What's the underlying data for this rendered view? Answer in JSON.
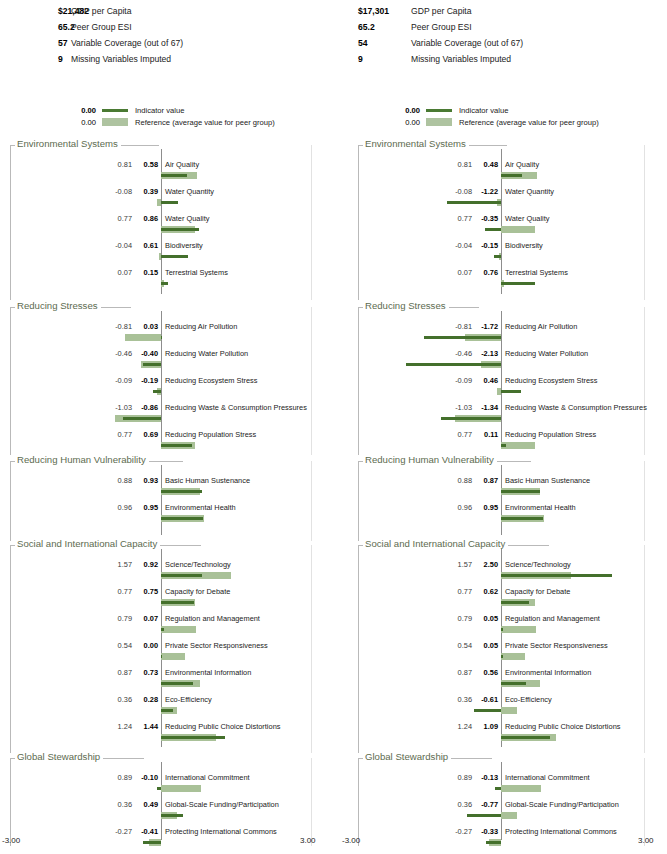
{
  "axis": {
    "min": -3.0,
    "max": 3.0,
    "min_label": "-3.00",
    "max_label": "3.00"
  },
  "colors": {
    "indicator": "#44702c",
    "reference": "#a9c198",
    "section_title": "#5d6b4f",
    "frame": "#b9b9b9",
    "zero_axis": "#8d8d8d"
  },
  "legend": {
    "indicator": {
      "value": "0.00",
      "label": "Indicator value"
    },
    "reference": {
      "value": "0.00",
      "label": "Reference (average value for peer group)"
    }
  },
  "panels": [
    {
      "id": "left-country",
      "stats": [
        {
          "value": "$21,482",
          "label": "GDP per Capita"
        },
        {
          "value": "65.2",
          "label": "Peer Group ESI"
        },
        {
          "value": "57",
          "label": "Variable Coverage (out of 67)"
        },
        {
          "value": "9",
          "label": "Missing Variables Imputed"
        }
      ],
      "sections": [
        {
          "title": "Environmental Systems",
          "rows": [
            {
              "name": "Air Quality",
              "reference": 0.81,
              "indicator": 0.58,
              "ref_label": "0.81",
              "ind_label": "0.58"
            },
            {
              "name": "Water Quantity",
              "reference": -0.08,
              "indicator": 0.39,
              "ref_label": "-0.08",
              "ind_label": "0.39"
            },
            {
              "name": "Water Quality",
              "reference": 0.77,
              "indicator": 0.86,
              "ref_label": "0.77",
              "ind_label": "0.86"
            },
            {
              "name": "Biodiversity",
              "reference": -0.04,
              "indicator": 0.61,
              "ref_label": "-0.04",
              "ind_label": "0.61"
            },
            {
              "name": "Terrestrial Systems",
              "reference": 0.07,
              "indicator": 0.15,
              "ref_label": "0.07",
              "ind_label": "0.15"
            }
          ]
        },
        {
          "title": "Reducing Stresses",
          "rows": [
            {
              "name": "Reducing Air Pollution",
              "reference": -0.81,
              "indicator": 0.03,
              "ref_label": "-0.81",
              "ind_label": "0.03"
            },
            {
              "name": "Reducing Water Pollution",
              "reference": -0.46,
              "indicator": -0.4,
              "ref_label": "-0.46",
              "ind_label": "-0.40"
            },
            {
              "name": "Reducing Ecosystem Stress",
              "reference": -0.09,
              "indicator": -0.19,
              "ref_label": "-0.09",
              "ind_label": "-0.19"
            },
            {
              "name": "Reducing Waste & Consumption Pressures",
              "reference": -1.03,
              "indicator": -0.86,
              "ref_label": "-1.03",
              "ind_label": "-0.86"
            },
            {
              "name": "Reducing Population Stress",
              "reference": 0.77,
              "indicator": 0.69,
              "ref_label": "0.77",
              "ind_label": "0.69"
            }
          ]
        },
        {
          "title": "Reducing Human Vulnerability",
          "rows": [
            {
              "name": "Basic Human Sustenance",
              "reference": 0.88,
              "indicator": 0.93,
              "ref_label": "0.88",
              "ind_label": "0.93"
            },
            {
              "name": "Environmental Health",
              "reference": 0.96,
              "indicator": 0.95,
              "ref_label": "0.96",
              "ind_label": "0.95"
            }
          ]
        },
        {
          "title": "Social and International Capacity",
          "rows": [
            {
              "name": "Science/Technology",
              "reference": 1.57,
              "indicator": 0.92,
              "ref_label": "1.57",
              "ind_label": "0.92"
            },
            {
              "name": "Capacity for Debate",
              "reference": 0.77,
              "indicator": 0.75,
              "ref_label": "0.77",
              "ind_label": "0.75"
            },
            {
              "name": "Regulation and Management",
              "reference": 0.79,
              "indicator": 0.07,
              "ref_label": "0.79",
              "ind_label": "0.07"
            },
            {
              "name": "Private Sector Responsiveness",
              "reference": 0.54,
              "indicator": 0.0,
              "ref_label": "0.54",
              "ind_label": "0.00"
            },
            {
              "name": "Environmental Information",
              "reference": 0.87,
              "indicator": 0.73,
              "ref_label": "0.87",
              "ind_label": "0.73"
            },
            {
              "name": "Eco-Efficiency",
              "reference": 0.36,
              "indicator": 0.28,
              "ref_label": "0.36",
              "ind_label": "0.28"
            },
            {
              "name": "Reducing Public Choice Distortions",
              "reference": 1.24,
              "indicator": 1.44,
              "ref_label": "1.24",
              "ind_label": "1.44"
            }
          ]
        },
        {
          "title": "Global Stewardship",
          "rows": [
            {
              "name": "International Commitment",
              "reference": 0.89,
              "indicator": -0.1,
              "ref_label": "0.89",
              "ind_label": "-0.10"
            },
            {
              "name": "Global-Scale Funding/Participation",
              "reference": 0.36,
              "indicator": 0.49,
              "ref_label": "0.36",
              "ind_label": "0.49"
            },
            {
              "name": "Protecting International Commons",
              "reference": -0.27,
              "indicator": -0.41,
              "ref_label": "-0.27",
              "ind_label": "-0.41"
            }
          ]
        }
      ]
    },
    {
      "id": "right-country",
      "stats": [
        {
          "value": "$17,301",
          "label": "GDP per Capita"
        },
        {
          "value": "65.2",
          "label": "Peer Group ESI"
        },
        {
          "value": "54",
          "label": "Variable Coverage (out of 67)"
        },
        {
          "value": "9",
          "label": "Missing Variables Imputed"
        }
      ],
      "sections": [
        {
          "title": "Environmental Systems",
          "rows": [
            {
              "name": "Air Quality",
              "reference": 0.81,
              "indicator": 0.48,
              "ref_label": "0.81",
              "ind_label": "0.48"
            },
            {
              "name": "Water Quantity",
              "reference": -0.08,
              "indicator": -1.22,
              "ref_label": "-0.08",
              "ind_label": "-1.22"
            },
            {
              "name": "Water Quality",
              "reference": 0.77,
              "indicator": -0.35,
              "ref_label": "0.77",
              "ind_label": "-0.35"
            },
            {
              "name": "Biodiversity",
              "reference": -0.04,
              "indicator": -0.15,
              "ref_label": "-0.04",
              "ind_label": "-0.15"
            },
            {
              "name": "Terrestrial Systems",
              "reference": 0.07,
              "indicator": 0.76,
              "ref_label": "0.07",
              "ind_label": "0.76"
            }
          ]
        },
        {
          "title": "Reducing Stresses",
          "rows": [
            {
              "name": "Reducing Air Pollution",
              "reference": -0.81,
              "indicator": -1.72,
              "ref_label": "-0.81",
              "ind_label": "-1.72"
            },
            {
              "name": "Reducing Water Pollution",
              "reference": -0.46,
              "indicator": -2.13,
              "ref_label": "-0.46",
              "ind_label": "-2.13"
            },
            {
              "name": "Reducing Ecosystem Stress",
              "reference": -0.09,
              "indicator": 0.46,
              "ref_label": "-0.09",
              "ind_label": "0.46"
            },
            {
              "name": "Reducing Waste & Consumption Pressures",
              "reference": -1.03,
              "indicator": -1.34,
              "ref_label": "-1.03",
              "ind_label": "-1.34"
            },
            {
              "name": "Reducing Population Stress",
              "reference": 0.77,
              "indicator": 0.11,
              "ref_label": "0.77",
              "ind_label": "0.11"
            }
          ]
        },
        {
          "title": "Reducing Human Vulnerability",
          "rows": [
            {
              "name": "Basic Human Sustenance",
              "reference": 0.88,
              "indicator": 0.87,
              "ref_label": "0.88",
              "ind_label": "0.87"
            },
            {
              "name": "Environmental Health",
              "reference": 0.96,
              "indicator": 0.95,
              "ref_label": "0.96",
              "ind_label": "0.95"
            }
          ]
        },
        {
          "title": "Social and International Capacity",
          "rows": [
            {
              "name": "Science/Technology",
              "reference": 1.57,
              "indicator": 2.5,
              "ref_label": "1.57",
              "ind_label": "2.50"
            },
            {
              "name": "Capacity for Debate",
              "reference": 0.77,
              "indicator": 0.62,
              "ref_label": "0.77",
              "ind_label": "0.62"
            },
            {
              "name": "Regulation and Management",
              "reference": 0.79,
              "indicator": 0.05,
              "ref_label": "0.79",
              "ind_label": "0.05"
            },
            {
              "name": "Private Sector Responsiveness",
              "reference": 0.54,
              "indicator": 0.05,
              "ref_label": "0.54",
              "ind_label": "0.05"
            },
            {
              "name": "Environmental Information",
              "reference": 0.87,
              "indicator": 0.56,
              "ref_label": "0.87",
              "ind_label": "0.56"
            },
            {
              "name": "Eco-Efficiency",
              "reference": 0.36,
              "indicator": -0.61,
              "ref_label": "0.36",
              "ind_label": "-0.61"
            },
            {
              "name": "Reducing Public Choice Distortions",
              "reference": 1.24,
              "indicator": 1.09,
              "ref_label": "1.24",
              "ind_label": "1.09"
            }
          ]
        },
        {
          "title": "Global Stewardship",
          "rows": [
            {
              "name": "International Commitment",
              "reference": 0.89,
              "indicator": -0.13,
              "ref_label": "0.89",
              "ind_label": "-0.13"
            },
            {
              "name": "Global-Scale Funding/Participation",
              "reference": 0.36,
              "indicator": -0.77,
              "ref_label": "0.36",
              "ind_label": "-0.77"
            },
            {
              "name": "Protecting International Commons",
              "reference": -0.27,
              "indicator": -0.33,
              "ref_label": "-0.27",
              "ind_label": "-0.33"
            }
          ]
        }
      ]
    }
  ],
  "chart_data": {
    "type": "bar",
    "title": "",
    "xlabel": "",
    "ylabel": "",
    "xlim": [
      -3.0,
      3.0
    ],
    "grid": false,
    "orientation": "horizontal",
    "legend_position": "top",
    "series": [
      {
        "name": "Indicator value",
        "color": "#44702c"
      },
      {
        "name": "Reference (average value for peer group)",
        "color": "#a9c198"
      }
    ],
    "panels": [
      {
        "name": "left-country",
        "categories": [
          "Air Quality",
          "Water Quantity",
          "Water Quality",
          "Biodiversity",
          "Terrestrial Systems",
          "Reducing Air Pollution",
          "Reducing Water Pollution",
          "Reducing Ecosystem Stress",
          "Reducing Waste & Consumption Pressures",
          "Reducing Population Stress",
          "Basic Human Sustenance",
          "Environmental Health",
          "Science/Technology",
          "Capacity for Debate",
          "Regulation and Management",
          "Private Sector Responsiveness",
          "Environmental Information",
          "Eco-Efficiency",
          "Reducing Public Choice Distortions",
          "International Commitment",
          "Global-Scale Funding/Participation",
          "Protecting International Commons"
        ],
        "indicator": [
          0.58,
          0.39,
          0.86,
          0.61,
          0.15,
          0.03,
          -0.4,
          -0.19,
          -0.86,
          0.69,
          0.93,
          0.95,
          0.92,
          0.75,
          0.07,
          0.0,
          0.73,
          0.28,
          1.44,
          -0.1,
          0.49,
          -0.41
        ],
        "reference": [
          0.81,
          -0.08,
          0.77,
          -0.04,
          0.07,
          -0.81,
          -0.46,
          -0.09,
          -1.03,
          0.77,
          0.88,
          0.96,
          1.57,
          0.77,
          0.79,
          0.54,
          0.87,
          0.36,
          1.24,
          0.89,
          0.36,
          -0.27
        ]
      },
      {
        "name": "right-country",
        "categories": [
          "Air Quality",
          "Water Quantity",
          "Water Quality",
          "Biodiversity",
          "Terrestrial Systems",
          "Reducing Air Pollution",
          "Reducing Water Pollution",
          "Reducing Ecosystem Stress",
          "Reducing Waste & Consumption Pressures",
          "Reducing Population Stress",
          "Basic Human Sustenance",
          "Environmental Health",
          "Science/Technology",
          "Capacity for Debate",
          "Regulation and Management",
          "Private Sector Responsiveness",
          "Environmental Information",
          "Eco-Efficiency",
          "Reducing Public Choice Distortions",
          "International Commitment",
          "Global-Scale Funding/Participation",
          "Protecting International Commons"
        ],
        "indicator": [
          0.48,
          -1.22,
          -0.35,
          -0.15,
          0.76,
          -1.72,
          -2.13,
          0.46,
          -1.34,
          0.11,
          0.87,
          0.95,
          2.5,
          0.62,
          0.05,
          0.05,
          0.56,
          -0.61,
          1.09,
          -0.13,
          -0.77,
          -0.33
        ],
        "reference": [
          0.81,
          -0.08,
          0.77,
          -0.04,
          0.07,
          -0.81,
          -0.46,
          -0.09,
          -1.03,
          0.77,
          0.88,
          0.96,
          1.57,
          0.77,
          0.79,
          0.54,
          0.87,
          0.36,
          1.24,
          0.89,
          0.36,
          -0.27
        ]
      }
    ]
  }
}
